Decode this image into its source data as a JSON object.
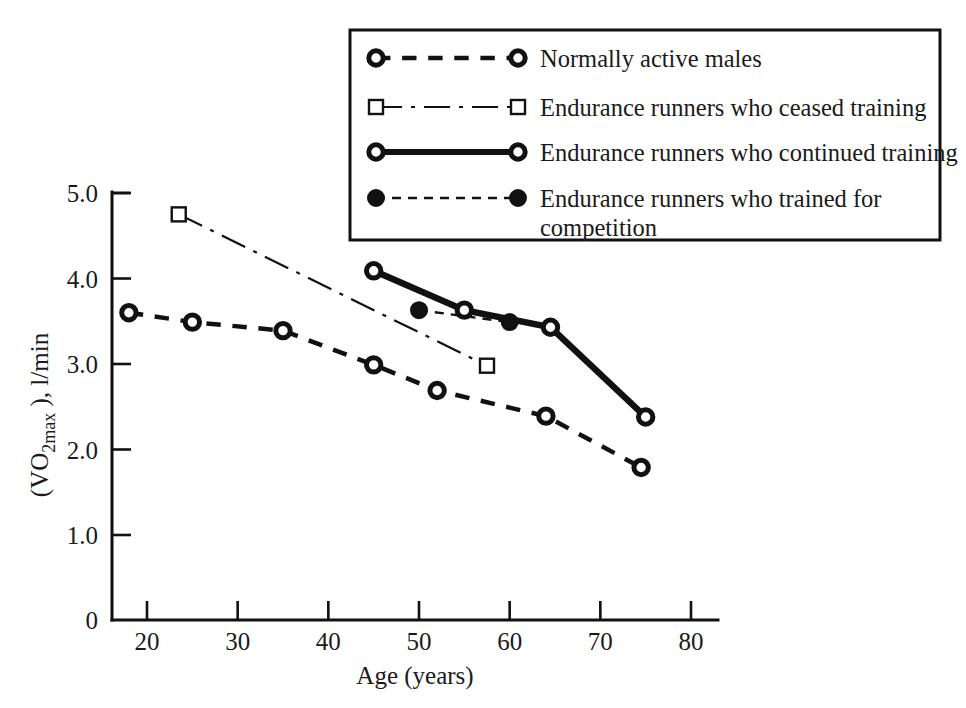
{
  "chart_data": {
    "type": "line",
    "title": "",
    "xlabel": "Age (years)",
    "ylabel": "(VO 2max ), l/min",
    "ylabel_parts": {
      "prefix": "(VO",
      "subscript": "2max",
      "suffix": " ), l/min"
    },
    "xlim": [
      15.5,
      81.5
    ],
    "ylim": [
      0.6,
      5.15
    ],
    "grid": false,
    "legend_position": "top-right",
    "x_ticks": [
      20,
      30,
      40,
      50,
      60,
      70,
      80
    ],
    "x_tick_labels": [
      "20",
      "30",
      "40",
      "50",
      "60",
      "70",
      "80"
    ],
    "y_ticks": [
      1.0,
      2.0,
      3.0,
      4.0,
      5.0
    ],
    "y_tick_labels": [
      "1.0",
      "2.0",
      "3.0",
      "4.0",
      "5.0"
    ],
    "y_origin_label": "0",
    "axis_break": true,
    "series": [
      {
        "name": "Normally active males",
        "marker": "open-circle",
        "linestyle": "dashed",
        "linewidth": 4.5,
        "color": "#111111",
        "x": [
          18,
          25,
          35,
          45,
          52,
          64,
          74.5
        ],
        "y": [
          3.6,
          3.49,
          3.39,
          2.99,
          2.69,
          2.39,
          1.79
        ]
      },
      {
        "name": "Endurance runners who ceased training",
        "marker": "open-square",
        "linestyle": "dashdot",
        "linewidth": 2.2,
        "color": "#111111",
        "x": [
          23.5,
          57.5
        ],
        "y": [
          4.75,
          2.98
        ]
      },
      {
        "name": "Endurance runners who continued training",
        "marker": "open-circle",
        "linestyle": "solid",
        "linewidth": 6.5,
        "color": "#111111",
        "x": [
          45,
          55,
          64.5,
          75
        ],
        "y": [
          4.09,
          3.63,
          3.43,
          2.38
        ]
      },
      {
        "name": "Endurance runners who trained for competition",
        "marker": "filled-circle",
        "linestyle": "dashed-thin",
        "linewidth": 2.4,
        "color": "#111111",
        "x": [
          50,
          60
        ],
        "y": [
          3.63,
          3.49
        ]
      }
    ]
  },
  "legend": {
    "entries": [
      {
        "label": "Normally active males",
        "marker": "open-circle",
        "linestyle": "dashed",
        "linewidth": 4.5
      },
      {
        "label": "Endurance runners who ceased training",
        "marker": "open-square",
        "linestyle": "dashdot",
        "linewidth": 2.2
      },
      {
        "label": "Endurance runners who continued training",
        "marker": "open-circle",
        "linestyle": "solid",
        "linewidth": 6.0
      },
      {
        "label": "Endurance runners who trained for",
        "label_line2": "competition",
        "marker": "filled-circle",
        "linestyle": "dashed-thin",
        "linewidth": 2.4
      }
    ]
  },
  "colors": {
    "ink": "#111111",
    "paper": "#ffffff"
  }
}
